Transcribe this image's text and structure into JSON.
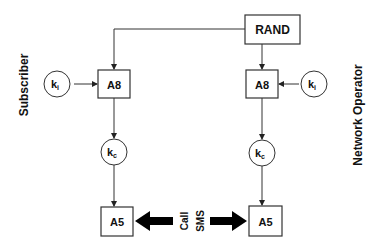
{
  "diagram": {
    "side_labels": {
      "left": "Subscriber",
      "right": "Network Operator"
    },
    "nodes": {
      "rand": "RAND",
      "a8_left": "A8",
      "a8_right": "A8",
      "a5_left": "A5",
      "a5_right": "A5",
      "ki_left": {
        "base": "k",
        "sub": "i"
      },
      "ki_right": {
        "base": "k",
        "sub": "i"
      },
      "kc_left": {
        "base": "k",
        "sub": "c"
      },
      "kc_right": {
        "base": "k",
        "sub": "c"
      }
    },
    "channel_labels": {
      "line1": "Call",
      "line2": "SMS"
    },
    "colors": {
      "stroke": "#333333",
      "fill": "#ffffff",
      "text": "#111111"
    }
  }
}
